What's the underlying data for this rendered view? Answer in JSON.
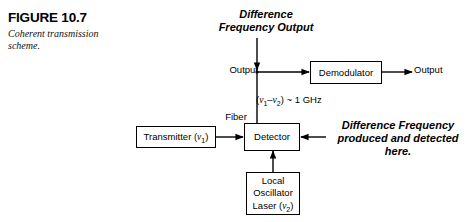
{
  "figure": {
    "number": "FIGURE 10.7",
    "caption": "Coherent transmission scheme."
  },
  "diagram": {
    "type": "block-diagram",
    "title": "Coherent transmission scheme",
    "blocks": [
      {
        "id": "transmitter",
        "label": "Transmitter (ν1)",
        "label_text": "Transmitter (",
        "symbol": "ν",
        "subscript": "1"
      },
      {
        "id": "detector",
        "label": "Detector"
      },
      {
        "id": "demodulator",
        "label": "Demodulator"
      },
      {
        "id": "local-oscillator",
        "label": "Local Oscillator Laser (ν2)",
        "line1": "Local",
        "line2": "Oscillator",
        "line3": "Laser (",
        "symbol": "ν",
        "subscript": "2"
      }
    ],
    "labels": {
      "difference_frequency_output": "Difference Frequency Output",
      "output_left": "Output",
      "output_right": "Output",
      "fiber": "Fiber",
      "frequency_difference_prefix": "(",
      "frequency_difference_nu1": "ν",
      "frequency_difference_sub1": "1",
      "frequency_difference_minus": "–",
      "frequency_difference_nu2": "ν",
      "frequency_difference_sub2": "2",
      "frequency_difference_suffix": ") ~ 1 GHz",
      "note": "Difference Frequency produced and detected here."
    },
    "colors": {
      "stroke": "#000000",
      "background": "#ffffff",
      "text": "#000000"
    }
  }
}
